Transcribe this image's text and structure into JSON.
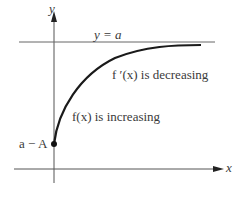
{
  "diagram": {
    "axes": {
      "x_label": "x",
      "y_label": "y"
    },
    "asymptote_label": "y = a",
    "start_point_label": "a − A",
    "annotations": {
      "derivative_note": "f ′(x) is decreasing",
      "function_note": "f(x) is increasing"
    },
    "colors": {
      "curve": "#1a1a1a",
      "axes": "#555555",
      "text": "#3a3a3a"
    }
  }
}
